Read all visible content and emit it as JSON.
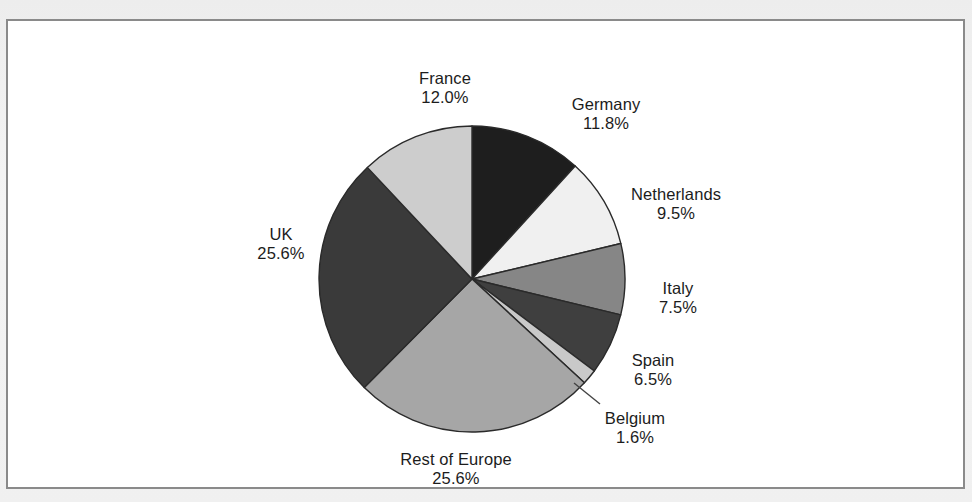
{
  "figure": {
    "background_color": "#ffffff",
    "frame_color": "#8a8a8a",
    "page_color": "#f0f0f0",
    "text_color": "#1c1c1c"
  },
  "chart_data": {
    "type": "pie",
    "title": "",
    "subtitle": "",
    "xlabel": "",
    "ylabel": "",
    "legend_position": "none",
    "grid": false,
    "label_format": "name + percent",
    "start_angle_deg": 0,
    "direction": "clockwise",
    "categories": [
      "Germany",
      "Netherlands",
      "Italy",
      "Spain",
      "Belgium",
      "Rest of Europe",
      "UK",
      "France"
    ],
    "values": [
      11.8,
      9.5,
      7.5,
      6.5,
      1.6,
      25.6,
      25.6,
      12.0
    ],
    "unit": "%",
    "slices": [
      {
        "name": "Germany",
        "value": 11.8,
        "percent_text": "11.8%",
        "color": "#1e1e1e",
        "label_x": 598,
        "label_y": 74,
        "leader": false
      },
      {
        "name": "Netherlands",
        "value": 9.5,
        "percent_text": "9.5%",
        "color": "#f0f0f0",
        "label_x": 668,
        "label_y": 164,
        "leader": false
      },
      {
        "name": "Italy",
        "value": 7.5,
        "percent_text": "7.5%",
        "color": "#868686",
        "label_x": 670,
        "label_y": 258,
        "leader": false
      },
      {
        "name": "Spain",
        "value": 6.5,
        "percent_text": "6.5%",
        "color": "#3f3f3f",
        "label_x": 645,
        "label_y": 330,
        "leader": false
      },
      {
        "name": "Belgium",
        "value": 1.6,
        "percent_text": "1.6%",
        "color": "#c9c9c9",
        "label_x": 627,
        "label_y": 388,
        "leader": true
      },
      {
        "name": "Rest of Europe",
        "value": 25.6,
        "percent_text": "25.6%",
        "color": "#a6a6a6",
        "label_x": 448,
        "label_y": 429,
        "leader": false
      },
      {
        "name": "UK",
        "value": 25.6,
        "percent_text": "25.6%",
        "color": "#3a3a3a",
        "label_x": 273,
        "label_y": 204,
        "leader": false
      },
      {
        "name": "France",
        "value": 12.0,
        "percent_text": "12.0%",
        "color": "#cdcdcd",
        "label_x": 437,
        "label_y": 48,
        "leader": false
      }
    ],
    "geometry": {
      "center_x": 464,
      "center_y": 258,
      "radius": 153,
      "outline_color": "#2a2a2a"
    },
    "leader_line": {
      "from_x": 566,
      "from_y": 362,
      "to_x": 592,
      "to_y": 383,
      "color": "#444444"
    }
  }
}
